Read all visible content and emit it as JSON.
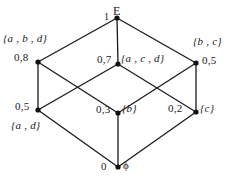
{
  "figure": {
    "type": "hasse-diagram-cube",
    "line_color": "#1a1a1a",
    "node_color": "#111111",
    "background": "#ffffff",
    "nodes": [
      {
        "id": "top",
        "set": "E",
        "measure": "1",
        "x": 117,
        "y": 18
      },
      {
        "id": "upper-left",
        "set": "{a , b , d}",
        "measure": "0,8",
        "x": 38,
        "y": 62
      },
      {
        "id": "upper-middle",
        "set": "{a , c , d}",
        "measure": "0,7",
        "x": 118,
        "y": 64
      },
      {
        "id": "upper-right",
        "set": "{b , c}",
        "measure": "0,5",
        "x": 196,
        "y": 63
      },
      {
        "id": "lower-left",
        "set": "{a , d}",
        "measure": "0,5",
        "x": 38,
        "y": 110
      },
      {
        "id": "center",
        "set": "{b}",
        "measure": "0,3",
        "x": 118,
        "y": 113
      },
      {
        "id": "lower-right",
        "set": "{c}",
        "measure": "0,2",
        "x": 196,
        "y": 112
      },
      {
        "id": "bottom",
        "set": "ϕ",
        "measure": "0",
        "x": 118,
        "y": 167
      }
    ],
    "edges": [
      {
        "from": "top",
        "to": "upper-left"
      },
      {
        "from": "top",
        "to": "upper-middle"
      },
      {
        "from": "top",
        "to": "upper-right"
      },
      {
        "from": "upper-left",
        "to": "lower-left"
      },
      {
        "from": "upper-left",
        "to": "center"
      },
      {
        "from": "upper-middle",
        "to": "lower-left"
      },
      {
        "from": "upper-middle",
        "to": "lower-right"
      },
      {
        "from": "upper-right",
        "to": "center"
      },
      {
        "from": "upper-right",
        "to": "lower-right"
      },
      {
        "from": "lower-left",
        "to": "bottom"
      },
      {
        "from": "center",
        "to": "bottom"
      },
      {
        "from": "lower-right",
        "to": "bottom"
      }
    ]
  }
}
